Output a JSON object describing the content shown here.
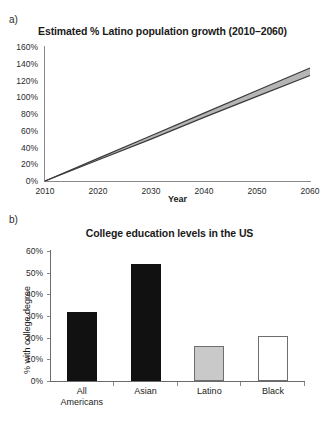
{
  "figure": {
    "panel_a_letter": "a)",
    "panel_b_letter": "b)"
  },
  "chart_data": [
    {
      "id": "latino-population-growth",
      "type": "line",
      "title": "Estimated % Latino population growth (2010–2060)",
      "xlabel": "Year",
      "ylabel": "",
      "xlim": [
        2010,
        2060
      ],
      "ylim": [
        0,
        160
      ],
      "grid": false,
      "legend": "none",
      "xticks": [
        "2010",
        "2020",
        "2030",
        "2040",
        "2050",
        "2060"
      ],
      "xtick_values": [
        2010,
        2020,
        2030,
        2040,
        2050,
        2060
      ],
      "yticks": [
        "0%",
        "20%",
        "40%",
        "60%",
        "80%",
        "100%",
        "120%",
        "140%",
        "160%"
      ],
      "ytick_values": [
        0,
        20,
        40,
        60,
        80,
        100,
        120,
        140,
        160
      ],
      "x": [
        2010,
        2020,
        2030,
        2040,
        2050,
        2060
      ],
      "series": [
        {
          "name": "upper bound",
          "values": [
            0,
            27,
            54,
            81,
            108,
            135
          ]
        },
        {
          "name": "lower bound",
          "values": [
            0,
            25,
            50,
            76,
            101,
            126
          ]
        }
      ],
      "band_fill": "#b5b5b5",
      "line_color": "#3a3a3a"
    },
    {
      "id": "college-education-levels",
      "type": "bar",
      "title": "College education levels in the US",
      "xlabel": "",
      "ylabel": "% with college degree",
      "ylim": [
        0,
        60
      ],
      "grid": false,
      "legend": "none",
      "yticks": [
        "0%",
        "10%",
        "20%",
        "30%",
        "40%",
        "50%",
        "60%"
      ],
      "ytick_values": [
        0,
        10,
        20,
        30,
        40,
        50,
        60
      ],
      "categories": [
        "All\nAmericans",
        "Asian",
        "Latino",
        "Black"
      ],
      "values": [
        32,
        54,
        16,
        21
      ],
      "bar_styles": [
        "dark",
        "dark",
        "gray",
        "white"
      ],
      "colors": {
        "dark": "#111111",
        "gray": "#c9c9c9",
        "white": "#ffffff",
        "outline": "#6e6e6e"
      }
    }
  ]
}
